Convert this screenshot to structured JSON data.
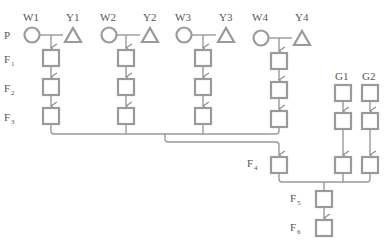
{
  "diagram": {
    "row_labels": {
      "p": "P",
      "f1": "F",
      "f1_sub": "1",
      "f2": "F",
      "f2_sub": "2",
      "f3": "F",
      "f3_sub": "3",
      "f4": "F",
      "f4_sub": "4",
      "f5": "F",
      "f5_sub": "5",
      "f6": "F",
      "f6_sub": "6"
    },
    "parents": [
      {
        "female": "W1",
        "male": "Y1"
      },
      {
        "female": "W2",
        "male": "Y2"
      },
      {
        "female": "W3",
        "male": "Y3"
      },
      {
        "female": "W4",
        "male": "Y4"
      }
    ],
    "extra_lines": [
      {
        "label": "G1"
      },
      {
        "label": "G2"
      }
    ],
    "legend_symbols": {
      "circle": "female",
      "triangle": "male",
      "square": "offspring"
    },
    "colors": {
      "stroke": "#9a9a9a",
      "text": "#555555"
    }
  }
}
